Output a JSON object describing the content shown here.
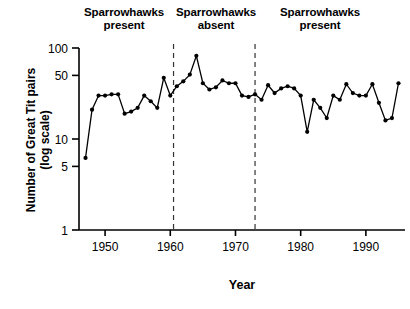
{
  "figure": {
    "width": 410,
    "height": 309,
    "background": "#ffffff",
    "line_color": "#000000",
    "marker_color": "#000000"
  },
  "annotations": [
    {
      "name": "sparrowhawks-present-early",
      "text": "Sparrowhawks\npresent"
    },
    {
      "name": "sparrowhawks-absent",
      "text": "Sparrowhawks\nabsent"
    },
    {
      "name": "sparrowhawks-present-late",
      "text": "Sparrowhawks\npresent"
    }
  ],
  "axis": {
    "ylabel": "Number of Great Tit pairs\n(log scale)",
    "xlabel": "Year"
  },
  "chart_data": {
    "type": "line",
    "title": "",
    "subtitle": "",
    "xlabel": "Year",
    "ylabel": "Number of Great Tit pairs (log scale)",
    "yscale": "log",
    "ylim": [
      1,
      100
    ],
    "xlim": [
      1946,
      1996
    ],
    "grid": false,
    "legend": null,
    "yticks": [
      1,
      5,
      10,
      50,
      100
    ],
    "ytick_labels": [
      "1",
      "5",
      "10",
      "50",
      "100"
    ],
    "xticks": [
      1950,
      1960,
      1970,
      1980,
      1990
    ],
    "xtick_labels": [
      "1950",
      "1960",
      "1970",
      "1980",
      "1990"
    ],
    "x": [
      1947,
      1948,
      1949,
      1950,
      1951,
      1952,
      1953,
      1954,
      1955,
      1956,
      1957,
      1958,
      1959,
      1960,
      1961,
      1962,
      1963,
      1964,
      1965,
      1966,
      1967,
      1968,
      1969,
      1970,
      1971,
      1972,
      1973,
      1974,
      1975,
      1976,
      1977,
      1978,
      1979,
      1980,
      1981,
      1982,
      1983,
      1984,
      1985,
      1986,
      1987,
      1988,
      1989,
      1990,
      1991,
      1992,
      1993,
      1994,
      1995
    ],
    "values": [
      6.2,
      21,
      30,
      30,
      31,
      31,
      19,
      20,
      22,
      30,
      26,
      22,
      47,
      30,
      38,
      43,
      51,
      82,
      41,
      35,
      37,
      44,
      41,
      41,
      30,
      29,
      31,
      27,
      39,
      32,
      36,
      38,
      36,
      30,
      12,
      27,
      22,
      17,
      30,
      27,
      40,
      32,
      30,
      30,
      40,
      25,
      16,
      17,
      41
    ],
    "annotations": [
      {
        "text": "Sparrowhawks present",
        "x_range": [
          1946,
          1961
        ]
      },
      {
        "text": "Sparrowhawks absent",
        "x_range": [
          1961,
          1973
        ]
      },
      {
        "text": "Sparrowhawks present",
        "x_range": [
          1973,
          1996
        ]
      }
    ],
    "vlines": [
      1960.5,
      1973
    ]
  }
}
